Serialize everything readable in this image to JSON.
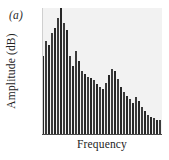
{
  "figure": {
    "panel_label": "(a)",
    "background_color": "#ffffff",
    "plot_background_color": "#f2f2f2",
    "bar_color": "#272727",
    "axis_color": "#4a4a4a"
  },
  "chart_data": {
    "type": "bar",
    "title": "",
    "subtitle": "",
    "panel": "(a)",
    "xlabel": "Frequency",
    "ylabel": "Amplitude (dB)",
    "xticklabels": [],
    "yticklabels": [],
    "grid": false,
    "legend": null,
    "xlim": [
      0,
      40
    ],
    "ylim": [
      0,
      100
    ],
    "categories": [
      "f1",
      "f2",
      "f3",
      "f4",
      "f5",
      "f6",
      "f7",
      "f8",
      "f9",
      "f10",
      "f11",
      "f12",
      "f13",
      "f14",
      "f15",
      "f16",
      "f17",
      "f18",
      "f19",
      "f20",
      "f21",
      "f22",
      "f23",
      "f24",
      "f25",
      "f26",
      "f27",
      "f28",
      "f29",
      "f30",
      "f31",
      "f32",
      "f33",
      "f34",
      "f35",
      "f36",
      "f37",
      "f38",
      "f39",
      "f40"
    ],
    "values": [
      62,
      74,
      71,
      80,
      84,
      92,
      100,
      88,
      83,
      62,
      54,
      66,
      58,
      50,
      48,
      46,
      45,
      43,
      40,
      38,
      36,
      41,
      47,
      52,
      50,
      44,
      38,
      34,
      31,
      28,
      25,
      30,
      27,
      22,
      19,
      16,
      14,
      13,
      12,
      12
    ]
  }
}
